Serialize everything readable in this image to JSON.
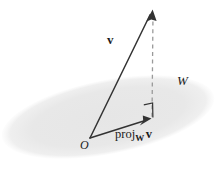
{
  "figure": {
    "background_color": "#ffffff",
    "line_color": "#333333",
    "plane_fill_color": "#e8e8e8",
    "dash_color": "#9a9a9a",
    "labels": {
      "vector_v": "v",
      "subspace_w": "W",
      "origin": "O",
      "projection_prefix": "proj",
      "projection_subscript": "W",
      "projection_vector": "v"
    },
    "geometry": {
      "origin_point": [
        90,
        138
      ],
      "vector_v_tip": [
        152,
        11
      ],
      "projection_tip": [
        150,
        119
      ],
      "dashed_line_from": [
        153,
        13
      ],
      "dashed_line_to": [
        152,
        117
      ],
      "plane_center": [
        108,
        117
      ],
      "plane_radius_x": 108,
      "plane_radius_y": 37,
      "plane_rotation_deg": -11
    }
  }
}
